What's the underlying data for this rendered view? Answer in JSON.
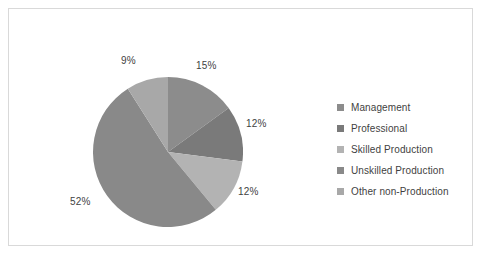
{
  "chart_data": {
    "type": "pie",
    "title": "",
    "labels": [
      "Management",
      "Professional",
      "Skilled Production",
      "Unskilled Production",
      "Other non-Production"
    ],
    "values": [
      15,
      12,
      12,
      52,
      9
    ],
    "value_labels": [
      "15%",
      "12%",
      "12%",
      "52%",
      "9%"
    ],
    "colors": [
      "#8c8c8c",
      "#7a7a7a",
      "#b3b3b3",
      "#898989",
      "#a8a8a8"
    ],
    "legend_position": "right",
    "grid": false,
    "units": "percent",
    "start_angle_deg": 0,
    "direction": "clockwise"
  },
  "legend": {
    "items": [
      {
        "label": "Management",
        "color": "#8c8c8c"
      },
      {
        "label": "Professional",
        "color": "#7a7a7a"
      },
      {
        "label": "Skilled Production",
        "color": "#b3b3b3"
      },
      {
        "label": "Unskilled Production",
        "color": "#898989"
      },
      {
        "label": "Other non-Production",
        "color": "#a8a8a8"
      }
    ]
  },
  "labels": {
    "management": "15%",
    "professional": "12%",
    "skilled": "12%",
    "unskilled": "52%",
    "other": "9%"
  },
  "style": {
    "border_color": "#d9d9d9",
    "background": "#ffffff",
    "text_color": "#3f3f3f"
  }
}
